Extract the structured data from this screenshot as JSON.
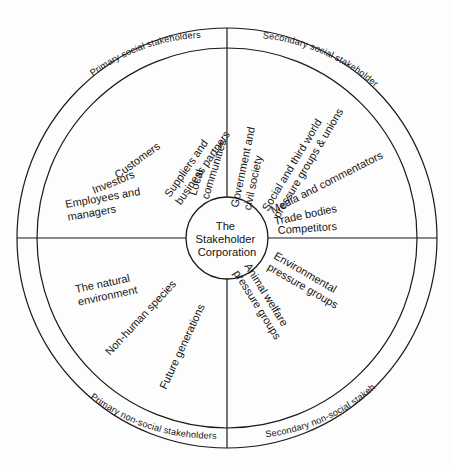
{
  "figure": {
    "title_strip": "",
    "caption": "",
    "background_color": "#fdfdfd",
    "line_color": "#1a1a1a",
    "text_color": "#141414"
  },
  "center": {
    "label_lines": [
      "The",
      "Stakeholder",
      "Corporation"
    ],
    "line1": "The",
    "line2": "Stakeholder",
    "line3": "Corporation"
  },
  "geometry": {
    "center_x": 227,
    "center_y": 238,
    "outer_radius": 210,
    "inner_ring_radius": 190,
    "core_radius": 41
  },
  "quadrants": [
    {
      "id": "primary-social",
      "ring_label": "Primary social stakeholders",
      "position": "upper-left",
      "items": [
        "Local communities",
        "Suppliers and business partners",
        "Customers",
        "Investors",
        "Employees and managers"
      ]
    },
    {
      "id": "secondary-social",
      "ring_label": "Secondary social stakeholders",
      "position": "upper-right",
      "items": [
        "Government and civil society",
        "Social and third world pressure groups & unions",
        "Media and commentators",
        "Trade bodies",
        "Competitors"
      ]
    },
    {
      "id": "primary-non-social",
      "ring_label": "Primary non-social stakeholders",
      "position": "lower-left",
      "items": [
        "The natural environment",
        "Non-human species",
        "Future generations"
      ]
    },
    {
      "id": "secondary-non-social",
      "ring_label": "Secondary non-social stakeholders",
      "position": "lower-right",
      "items": [
        "Environmental pressure groups",
        "Animal welfare pressure groups"
      ]
    }
  ],
  "spokes": {
    "ul_1_a": "Local",
    "ul_1_b": "communities",
    "ul_2_a": "Suppliers and",
    "ul_2_b": "business partners",
    "ul_3": "Customers",
    "ul_4": "Investors",
    "ul_5_a": "Employees and",
    "ul_5_b": "managers",
    "ur_1_a": "Government and",
    "ur_1_b": "civil society",
    "ur_2_a": "Social and third world",
    "ur_2_b": "pressure groups & unions",
    "ur_3": "Media and commentators",
    "ur_4": "Trade bodies",
    "ur_5": "Competitors",
    "ll_1_a": "The natural",
    "ll_1_b": "environment",
    "ll_2": "Non-human species",
    "ll_3": "Future generations",
    "lr_1_a": "Environmental",
    "lr_1_b": "pressure groups",
    "lr_2_a": "Animal welfare",
    "lr_2_b": "pressure groups"
  },
  "ring_labels": {
    "primary_social": "Primary social stakeholders",
    "secondary_social": "Secondary social stakeholders",
    "primary_non_social": "Primary non-social stakeholders",
    "secondary_non_social": "Secondary non-social stakeholders"
  }
}
